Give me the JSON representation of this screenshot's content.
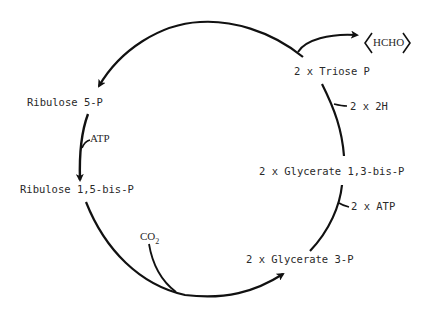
{
  "diagram": {
    "type": "metabolic-cycle",
    "nodes": [
      {
        "id": "triose",
        "label": "2 x Triose P"
      },
      {
        "id": "gly13",
        "label": "2 x Glycerate 1,3-bis-P"
      },
      {
        "id": "gly3",
        "label": "2 x Glycerate 3-P"
      },
      {
        "id": "rubp",
        "label": "Ribulose 1,5-bis-P"
      },
      {
        "id": "ru5p",
        "label": "Ribulose 5-P"
      }
    ],
    "side_inputs": {
      "h2": "2 x 2H",
      "atp2": "2 x ATP",
      "atp": "ATP",
      "co2_main": "CO",
      "co2_sub": "2"
    },
    "output": {
      "hcho": "HCHO"
    },
    "colors": {
      "line": "#111111",
      "text": "#2a2a2a",
      "background": "#ffffff"
    }
  }
}
